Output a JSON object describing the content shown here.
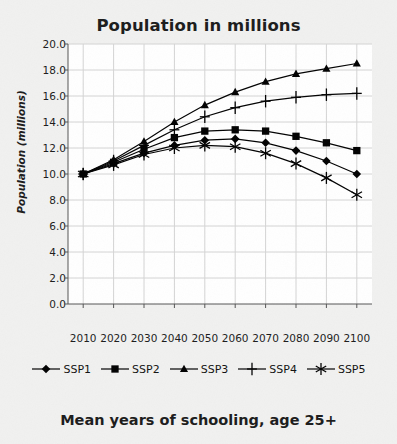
{
  "chart_data": {
    "type": "line",
    "title": "Population in millions",
    "caption": "Mean years of schooling, age 25+",
    "xlabel": "",
    "ylabel": "Population (millions)",
    "x": [
      2010,
      2020,
      2030,
      2040,
      2050,
      2060,
      2070,
      2080,
      2090,
      2100
    ],
    "categories": [
      "2010",
      "2020",
      "2030",
      "2040",
      "2050",
      "2060",
      "2070",
      "2080",
      "2090",
      "2100"
    ],
    "xlim": [
      2005,
      2105
    ],
    "ylim": [
      0.0,
      20.0
    ],
    "yticks": [
      "0.0",
      "2.0",
      "4.0",
      "6.0",
      "8.0",
      "10.0",
      "12.0",
      "14.0",
      "16.0",
      "18.0",
      "20.0"
    ],
    "ytick_values": [
      0.0,
      2.0,
      4.0,
      6.0,
      8.0,
      10.0,
      12.0,
      14.0,
      16.0,
      18.0,
      20.0
    ],
    "grid": true,
    "legend_position": "below",
    "line_color": "#000000",
    "grid_color": "#d4d4d4",
    "plot_background": "#ffffff",
    "figure_background": "#f1f1f0",
    "series": [
      {
        "name": "SSP1",
        "marker": "diamond",
        "values": [
          10.0,
          10.8,
          11.6,
          12.2,
          12.6,
          12.7,
          12.4,
          11.8,
          11.0,
          10.0
        ]
      },
      {
        "name": "SSP2",
        "marker": "square",
        "values": [
          10.0,
          10.9,
          11.9,
          12.8,
          13.3,
          13.4,
          13.3,
          12.9,
          12.4,
          11.8
        ]
      },
      {
        "name": "SSP3",
        "marker": "triangle",
        "values": [
          10.0,
          11.1,
          12.5,
          14.0,
          15.3,
          16.3,
          17.1,
          17.7,
          18.1,
          18.5
        ]
      },
      {
        "name": "SSP4",
        "marker": "plus",
        "values": [
          10.0,
          11.0,
          12.2,
          13.4,
          14.4,
          15.1,
          15.6,
          15.9,
          16.1,
          16.2
        ]
      },
      {
        "name": "SSP5",
        "marker": "asterisk",
        "values": [
          10.0,
          10.7,
          11.5,
          12.0,
          12.2,
          12.1,
          11.6,
          10.8,
          9.7,
          8.4
        ]
      }
    ]
  }
}
